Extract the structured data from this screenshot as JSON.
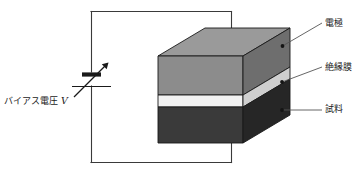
{
  "figure": {
    "title": "",
    "labels": {
      "bias_voltage": "バイアス電圧 ",
      "bias_voltage_symbol": "V",
      "electrode": "電極",
      "insulating_film": "絶縁膜",
      "sample": "試料"
    },
    "colors": {
      "wire": "#3a3a3a",
      "outline": "#1a1a1a",
      "electrode_top": "#9a9a9a",
      "electrode_front": "#8c8c8c",
      "electrode_side": "#6e6e6e",
      "insulator_front": "#f2f2f2",
      "insulator_side": "#cfcfcf",
      "sample_front": "#3a3a3a",
      "sample_side": "#262626",
      "leader": "#555555",
      "text": "#1a1a1a",
      "background": "#ffffff"
    },
    "components": {
      "source_name": "variable-bias-voltage-source",
      "stack_name": "mis-capacitor-stack",
      "layers": [
        "電極",
        "絶縁膜",
        "試料"
      ]
    }
  }
}
